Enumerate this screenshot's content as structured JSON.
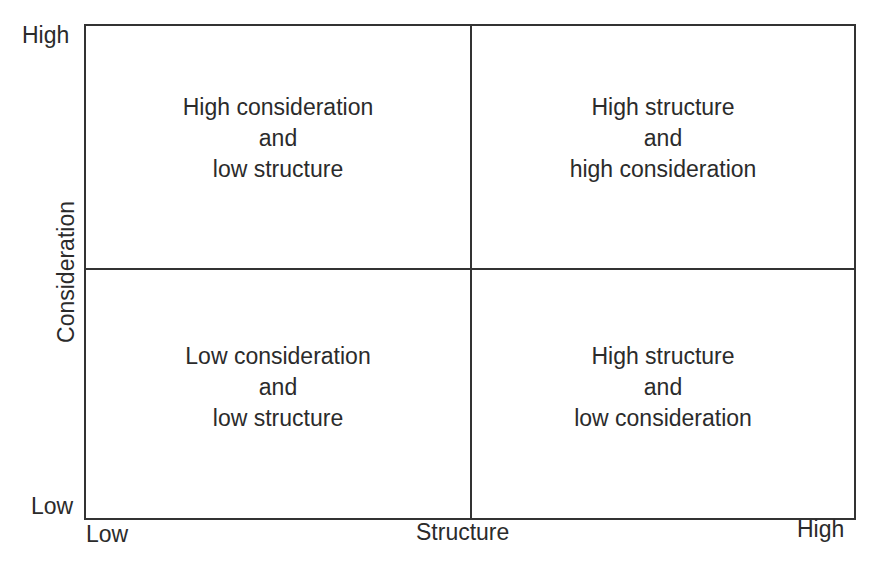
{
  "diagram": {
    "type": "2x2 matrix",
    "x_axis": {
      "title": "Structure",
      "low_label": "Low",
      "high_label": "High"
    },
    "y_axis": {
      "title": "Consideration",
      "low_label": "Low",
      "high_label": "High"
    },
    "quadrants": {
      "top_left": {
        "lines": [
          "High consideration",
          "and",
          "low structure"
        ]
      },
      "top_right": {
        "lines": [
          "High structure",
          "and",
          "high consideration"
        ]
      },
      "bottom_left": {
        "lines": [
          "Low consideration",
          "and",
          "low structure"
        ]
      },
      "bottom_right": {
        "lines": [
          "High structure",
          "and",
          "low consideration"
        ]
      }
    },
    "colors": {
      "line": "#333333",
      "text": "#2b2b2b",
      "background": "#ffffff"
    }
  }
}
